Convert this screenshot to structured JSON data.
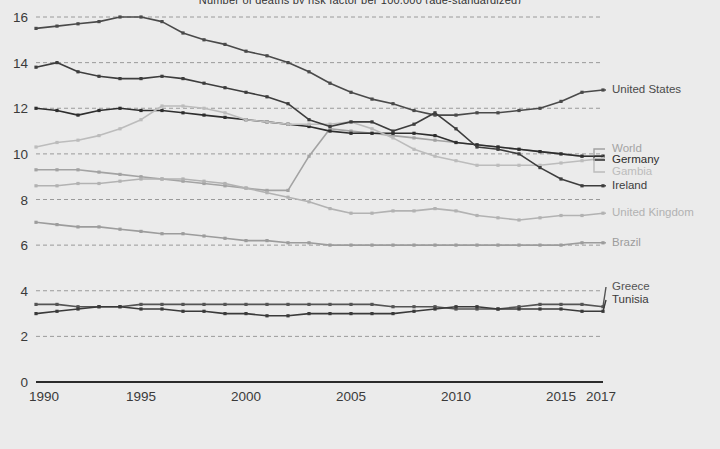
{
  "chart_title": "Number of deaths by risk factor per 100,000 (age-standardized)",
  "axis": {
    "y_ticks": [
      "0",
      "2",
      "4",
      "6",
      "8",
      "10",
      "12",
      "14",
      "16"
    ],
    "x_ticks": [
      "1990",
      "1995",
      "2000",
      "2005",
      "2010",
      "2015",
      "2017"
    ],
    "y_min": 0,
    "y_max": 16.6,
    "x_min": 1990,
    "x_max": 2017
  },
  "colors": {
    "background": "#ebebeb",
    "gridline": "#9a9a9a",
    "axis": "#2b2b2b",
    "tick_text": "#3a3a3a",
    "united_states": "#4a4a4a",
    "world": "#a3a3a3",
    "germany": "#2e2e2e",
    "gambia": "#bcbcbc",
    "ireland": "#3d3d3d",
    "united_kingdom": "#b2b2b2",
    "brazil": "#9c9c9c",
    "greece": "#545454",
    "tunisia": "#3a3a3a"
  },
  "chart_data": {
    "type": "line",
    "title": "Number of deaths by risk factor per 100,000 (age-standardized)",
    "xlabel": "",
    "ylabel": "",
    "xlim": [
      1990,
      2017
    ],
    "ylim": [
      0,
      16.6
    ],
    "grid": true,
    "legend_position": "right",
    "x": [
      1990,
      1991,
      1992,
      1993,
      1994,
      1995,
      1996,
      1997,
      1998,
      1999,
      2000,
      2001,
      2002,
      2003,
      2004,
      2005,
      2006,
      2007,
      2008,
      2009,
      2010,
      2011,
      2012,
      2013,
      2014,
      2015,
      2016,
      2017
    ],
    "series": [
      {
        "name": "United States",
        "color": "#4a4a4a",
        "values": [
          15.5,
          15.6,
          15.7,
          15.8,
          16.0,
          16.0,
          15.8,
          15.3,
          15.0,
          14.8,
          14.5,
          14.3,
          14.0,
          13.6,
          13.1,
          12.7,
          12.4,
          12.2,
          11.9,
          11.7,
          11.7,
          11.8,
          11.8,
          11.9,
          12.0,
          12.3,
          12.7,
          12.8
        ]
      },
      {
        "name": "World",
        "color": "#a3a3a3",
        "values": [
          9.3,
          9.3,
          9.3,
          9.2,
          9.1,
          9.0,
          8.9,
          8.8,
          8.7,
          8.6,
          8.5,
          8.4,
          8.4,
          9.9,
          11.1,
          11.0,
          10.9,
          10.8,
          10.7,
          10.6,
          10.5,
          10.4,
          10.3,
          10.2,
          10.1,
          10.0,
          9.9,
          9.9
        ]
      },
      {
        "name": "Germany",
        "color": "#2e2e2e",
        "values": [
          12.0,
          11.9,
          11.7,
          11.9,
          12.0,
          11.9,
          11.9,
          11.8,
          11.7,
          11.6,
          11.5,
          11.4,
          11.3,
          11.2,
          11.0,
          10.9,
          10.9,
          10.9,
          10.9,
          10.8,
          10.5,
          10.4,
          10.3,
          10.2,
          10.1,
          10.0,
          9.9,
          9.9
        ]
      },
      {
        "name": "Gambia",
        "color": "#bcbcbc",
        "values": [
          10.3,
          10.5,
          10.6,
          10.8,
          11.1,
          11.5,
          12.1,
          12.1,
          12.0,
          11.8,
          11.5,
          11.4,
          11.3,
          11.3,
          11.3,
          11.4,
          11.1,
          10.7,
          10.2,
          9.9,
          9.7,
          9.5,
          9.5,
          9.5,
          9.5,
          9.6,
          9.7,
          9.8
        ]
      },
      {
        "name": "Ireland",
        "color": "#3d3d3d",
        "values": [
          13.8,
          14.0,
          13.6,
          13.4,
          13.3,
          13.3,
          13.4,
          13.3,
          13.1,
          12.9,
          12.7,
          12.5,
          12.2,
          11.5,
          11.2,
          11.4,
          11.4,
          11.0,
          11.3,
          11.8,
          11.1,
          10.3,
          10.2,
          10.0,
          9.4,
          8.9,
          8.6,
          8.6
        ]
      },
      {
        "name": "United Kingdom",
        "color": "#b2b2b2",
        "values": [
          8.6,
          8.6,
          8.7,
          8.7,
          8.8,
          8.9,
          8.9,
          8.9,
          8.8,
          8.7,
          8.5,
          8.3,
          8.1,
          7.9,
          7.6,
          7.4,
          7.4,
          7.5,
          7.5,
          7.6,
          7.5,
          7.3,
          7.2,
          7.1,
          7.2,
          7.3,
          7.3,
          7.4
        ]
      },
      {
        "name": "Brazil",
        "color": "#9c9c9c",
        "values": [
          7.0,
          6.9,
          6.8,
          6.8,
          6.7,
          6.6,
          6.5,
          6.5,
          6.4,
          6.3,
          6.2,
          6.2,
          6.1,
          6.1,
          6.0,
          6.0,
          6.0,
          6.0,
          6.0,
          6.0,
          6.0,
          6.0,
          6.0,
          6.0,
          6.0,
          6.0,
          6.1,
          6.1
        ]
      },
      {
        "name": "Greece",
        "color": "#545454",
        "values": [
          3.4,
          3.4,
          3.3,
          3.3,
          3.3,
          3.4,
          3.4,
          3.4,
          3.4,
          3.4,
          3.4,
          3.4,
          3.4,
          3.4,
          3.4,
          3.4,
          3.4,
          3.3,
          3.3,
          3.3,
          3.2,
          3.2,
          3.2,
          3.3,
          3.4,
          3.4,
          3.4,
          3.3
        ]
      },
      {
        "name": "Tunisia",
        "color": "#3a3a3a",
        "values": [
          3.0,
          3.1,
          3.2,
          3.3,
          3.3,
          3.2,
          3.2,
          3.1,
          3.1,
          3.0,
          3.0,
          2.9,
          2.9,
          3.0,
          3.0,
          3.0,
          3.0,
          3.0,
          3.1,
          3.2,
          3.3,
          3.3,
          3.2,
          3.2,
          3.2,
          3.2,
          3.1,
          3.1
        ]
      }
    ]
  },
  "legend": [
    {
      "label": "United States",
      "color": "#4a4a4a"
    },
    {
      "label": "World",
      "color": "#a3a3a3"
    },
    {
      "label": "Germany",
      "color": "#2e2e2e"
    },
    {
      "label": "Gambia",
      "color": "#bcbcbc"
    },
    {
      "label": "Ireland",
      "color": "#3d3d3d"
    },
    {
      "label": "United Kingdom",
      "color": "#b2b2b2"
    },
    {
      "label": "Brazil",
      "color": "#9c9c9c"
    },
    {
      "label": "Greece",
      "color": "#545454"
    },
    {
      "label": "Tunisia",
      "color": "#3a3a3a"
    }
  ]
}
